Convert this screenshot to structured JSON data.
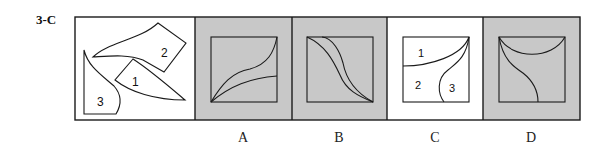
{
  "problem": {
    "id": "3-C",
    "stimulus": {
      "description": "Three numbered puzzle pieces",
      "piece_labels": [
        "1",
        "2",
        "3"
      ]
    },
    "options": [
      {
        "label": "A",
        "background": "#c8c8c8"
      },
      {
        "label": "B",
        "background": "#c8c8c8"
      },
      {
        "label": "C",
        "background": "#ffffff",
        "region_labels": [
          "1",
          "2",
          "3"
        ]
      },
      {
        "label": "D",
        "background": "#c8c8c8"
      }
    ]
  },
  "colors": {
    "stroke": "#1a1a1a",
    "shaded": "#c8c8c8",
    "plain": "#ffffff"
  }
}
